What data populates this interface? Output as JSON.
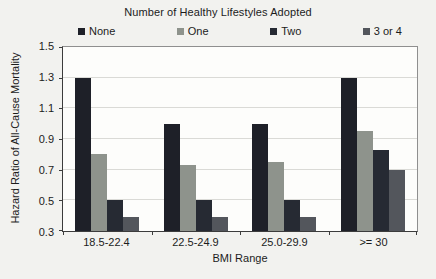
{
  "chart_data": {
    "type": "bar",
    "title": "Number of Healthy Lifestyles Adopted",
    "xlabel": "BMI Range",
    "ylabel": "Hazard Ratio of All-Cause Mortality",
    "categories": [
      "18.5-22.4",
      "22.5-24.9",
      "25.0-29.9",
      ">= 30"
    ],
    "series": [
      {
        "name": "None",
        "color": "#1e2028",
        "values": [
          1.3,
          1.0,
          1.0,
          1.3
        ]
      },
      {
        "name": "One",
        "color": "#8e938c",
        "values": [
          0.8,
          0.73,
          0.75,
          0.95
        ]
      },
      {
        "name": "Two",
        "color": "#262a33",
        "values": [
          0.5,
          0.5,
          0.5,
          0.83
        ]
      },
      {
        "name": "3 or 4",
        "color": "#53565c",
        "values": [
          0.39,
          0.39,
          0.39,
          0.7
        ]
      }
    ],
    "ylim": [
      0.3,
      1.5
    ],
    "yticks": [
      0.3,
      0.5,
      0.7,
      0.9,
      1.1,
      1.3,
      1.5
    ],
    "grid": true,
    "legend_position": "top",
    "plot_background": "#fdfdfb",
    "gridline_color": "#dadad6"
  }
}
